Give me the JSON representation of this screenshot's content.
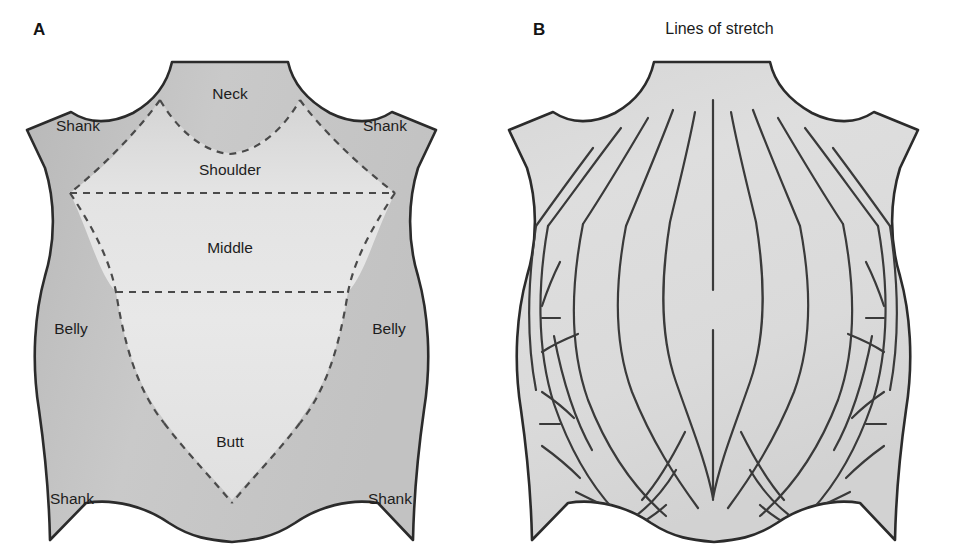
{
  "figure": {
    "background_color": "#ffffff",
    "outline_color": "#2b2b2b",
    "hide_fill_light": "#e2e2e2",
    "hide_fill_mid": "#d2d2d2",
    "hide_fill_dark": "#bdbdbd",
    "dashed_line_color": "#4a4a4a",
    "stretch_line_color": "#3a3a3a"
  },
  "panels": [
    {
      "letter": "A",
      "title": "",
      "regions": [
        {
          "name": "neck",
          "label": "Neck",
          "x": 230,
          "y": 95
        },
        {
          "name": "shank-top-left",
          "label": "Shank",
          "x": 78,
          "y": 127
        },
        {
          "name": "shank-top-right",
          "label": "Shank",
          "x": 385,
          "y": 127
        },
        {
          "name": "shoulder",
          "label": "Shoulder",
          "x": 230,
          "y": 171
        },
        {
          "name": "middle",
          "label": "Middle",
          "x": 230,
          "y": 249
        },
        {
          "name": "belly-left",
          "label": "Belly",
          "x": 71,
          "y": 330
        },
        {
          "name": "belly-right",
          "label": "Belly",
          "x": 389,
          "y": 330
        },
        {
          "name": "butt",
          "label": "Butt",
          "x": 230,
          "y": 443
        },
        {
          "name": "shank-bottom-left",
          "label": "Shank",
          "x": 72,
          "y": 500
        },
        {
          "name": "shank-bottom-right",
          "label": "Shank",
          "x": 390,
          "y": 500
        }
      ]
    },
    {
      "letter": "B",
      "title": "Lines of stretch",
      "regions": []
    }
  ]
}
